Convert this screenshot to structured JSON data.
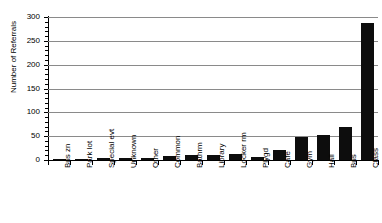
{
  "chart_data": {
    "type": "bar",
    "title": "",
    "xlabel": "",
    "ylabel": "Number of Referrals",
    "ylim": [
      0,
      300
    ],
    "ytick_labels": [
      "300",
      "250",
      "200",
      "150",
      "100",
      "50",
      "0"
    ],
    "ytick_values": [
      300,
      250,
      200,
      150,
      100,
      50,
      0
    ],
    "ytick_step": 50,
    "yminor_step": 10,
    "grid": "horizontal",
    "legend": "none",
    "bar_color": "#0d0d0d",
    "categories": [
      "Bus zn",
      "Park lot",
      "Special evt",
      "Unknown",
      "Other",
      "Common",
      "Bathrm",
      "Library",
      "Locker rm",
      "Plygd",
      "Cafe",
      "Gym",
      "Hall",
      "Bus",
      "Class"
    ],
    "values": [
      2,
      3,
      4,
      4,
      5,
      8,
      11,
      11,
      12,
      6,
      21,
      48,
      52,
      69,
      288
    ]
  }
}
